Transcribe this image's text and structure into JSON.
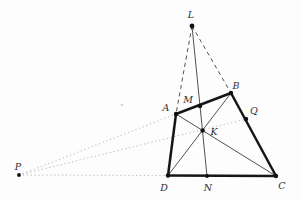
{
  "figure": {
    "width": 301,
    "height": 201,
    "background": "#fdfdfd",
    "label_color": "#2e2e2e",
    "dot_color": "#111111",
    "styles": {
      "bold": {
        "stroke": "#161616",
        "width": 2.5,
        "dash": null
      },
      "thin": {
        "stroke": "#3d3d3d",
        "width": 0.9,
        "dash": null
      },
      "dashed": {
        "stroke": "#3d3d3d",
        "width": 0.9,
        "dash": "4,3.5"
      },
      "dotted": {
        "stroke": "#bcbcbc",
        "width": 1,
        "dash": "1.3,2.6"
      }
    },
    "points": {
      "L": {
        "label": "L",
        "x": 192,
        "y": 26,
        "r": 2.4,
        "lx": 191,
        "ly": 15
      },
      "A": {
        "label": "A",
        "x": 176,
        "y": 114,
        "r": 2.2,
        "lx": 166,
        "ly": 108
      },
      "M": {
        "label": "M",
        "x": 200,
        "y": 106,
        "r": 2.2,
        "lx": 188,
        "ly": 100
      },
      "B": {
        "label": "B",
        "x": 231,
        "y": 93,
        "r": 2.2,
        "lx": 236,
        "ly": 86
      },
      "Q": {
        "label": "Q",
        "x": 246,
        "y": 119,
        "r": 2.2,
        "lx": 254,
        "ly": 111
      },
      "K": {
        "label": "K",
        "x": 202.6,
        "y": 130.5,
        "r": 2.2,
        "lx": 214,
        "ly": 132
      },
      "P": {
        "label": "P",
        "x": 19,
        "y": 175,
        "r": 1.9,
        "lx": 18,
        "ly": 167
      },
      "D": {
        "label": "D",
        "x": 168,
        "y": 175.5,
        "r": 2.2,
        "lx": 164,
        "ly": 188
      },
      "N": {
        "label": "N",
        "x": 207,
        "y": 176,
        "r": 1.9,
        "lx": 208,
        "ly": 188
      },
      "C": {
        "label": "C",
        "x": 276,
        "y": 176,
        "r": 2.2,
        "lx": 282,
        "ly": 186
      }
    },
    "edges": [
      {
        "from": "P",
        "to": "A",
        "style": "dotted"
      },
      {
        "from": "P",
        "to": "Q",
        "style": "dotted"
      },
      {
        "from": "P",
        "to": "D",
        "style": "dotted"
      },
      {
        "from": "L",
        "to": "A",
        "style": "dashed"
      },
      {
        "from": "L",
        "to": "B",
        "style": "dashed"
      },
      {
        "from": "L",
        "to": "N",
        "style": "thin"
      },
      {
        "from": "A",
        "to": "C",
        "style": "thin"
      },
      {
        "from": "B",
        "to": "D",
        "style": "thin"
      },
      {
        "from": "A",
        "to": "B",
        "style": "bold"
      },
      {
        "from": "B",
        "to": "C",
        "style": "bold"
      },
      {
        "from": "C",
        "to": "D",
        "style": "bold"
      },
      {
        "from": "D",
        "to": "A",
        "style": "bold"
      }
    ],
    "stray_mark": {
      "x": 122,
      "y": 105,
      "r": 1.3,
      "color": "#d4d4d4"
    }
  }
}
